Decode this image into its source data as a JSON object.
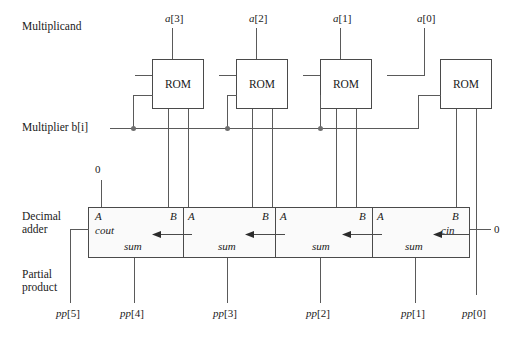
{
  "diagram": {
    "row_labels": {
      "multiplicand": "Multiplicand",
      "multiplier": "Multiplier b[i]",
      "decimal_adder": "Decimal adder",
      "partial_product": "Partial product"
    },
    "multiplicand_bits": [
      {
        "name": "a[3]",
        "base": "a",
        "index": "[3]"
      },
      {
        "name": "a[2]",
        "base": "a",
        "index": "[2]"
      },
      {
        "name": "a[1]",
        "base": "a",
        "index": "[1]"
      },
      {
        "name": "a[0]",
        "base": "a",
        "index": "[0]"
      }
    ],
    "rom_blocks": [
      {
        "label": "ROM"
      },
      {
        "label": "ROM"
      },
      {
        "label": "ROM"
      },
      {
        "label": "ROM"
      }
    ],
    "adder_cells": [
      {
        "a": "A",
        "b": "B",
        "sum": "sum"
      },
      {
        "a": "A",
        "b": "B",
        "sum": "sum"
      },
      {
        "a": "A",
        "b": "B",
        "sum": "sum"
      },
      {
        "a": "A",
        "b": "B",
        "sum": "sum"
      }
    ],
    "adder_terminals": {
      "cout": "cout",
      "cin": "cin"
    },
    "constants": {
      "a_input_zero": "0",
      "cin_zero": "0"
    },
    "partial_products": [
      {
        "name": "pp[5]",
        "base": "pp",
        "index": "[5]"
      },
      {
        "name": "pp[4]",
        "base": "pp",
        "index": "[4]"
      },
      {
        "name": "pp[3]",
        "base": "pp",
        "index": "[3]"
      },
      {
        "name": "pp[2]",
        "base": "pp",
        "index": "[2]"
      },
      {
        "name": "pp[1]",
        "base": "pp",
        "index": "[1]"
      },
      {
        "name": "pp[0]",
        "base": "pp",
        "index": "[0]"
      }
    ],
    "colors": {
      "wire": "#5a5a5a",
      "box_border": "#4a4a4a",
      "adder_fill": "#fafafa",
      "text": "#1a1a1a",
      "junction_dot": "#6e6e6e"
    }
  }
}
